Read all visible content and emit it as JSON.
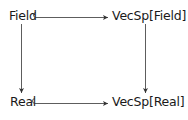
{
  "diagram": {
    "type": "commutative-diagram",
    "nodes": {
      "top_left": "Field",
      "top_right": "VecSp[Field]",
      "bottom_left": "Real",
      "bottom_right": "VecSp[Real]"
    },
    "edges": [
      {
        "from": "Field",
        "to": "VecSp[Field]",
        "style": "hook-arrow"
      },
      {
        "from": "Real",
        "to": "VecSp[Real]",
        "style": "hook-arrow"
      },
      {
        "from": "Field",
        "to": "Real",
        "style": "arrow"
      },
      {
        "from": "VecSp[Field]",
        "to": "VecSp[Real]",
        "style": "arrow"
      }
    ],
    "colors": {
      "text": "#1a1a1a",
      "arrow": "#333333",
      "background": "#ffffff"
    }
  }
}
